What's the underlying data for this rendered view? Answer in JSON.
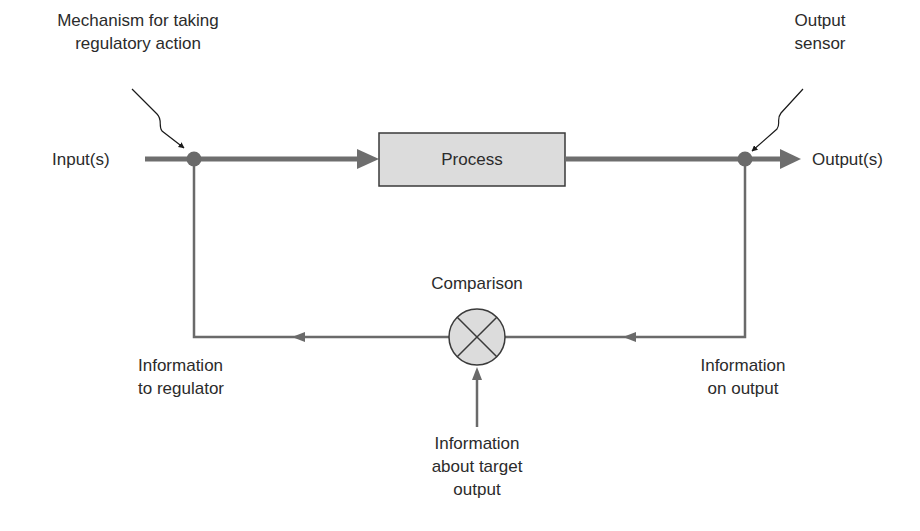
{
  "diagram": {
    "type": "feedback control loop",
    "nodes": {
      "process": {
        "label": "Process"
      },
      "comparison": {
        "label": "Comparison",
        "symbol": "circle-with-x"
      },
      "regulator_node": {
        "description": "mechanism junction on input line"
      },
      "sensor_node": {
        "description": "output sensor junction"
      }
    },
    "labels": {
      "mechanism": {
        "lines": [
          "Mechanism for taking",
          "regulatory action"
        ]
      },
      "output_sensor": {
        "lines": [
          "Output",
          "sensor"
        ]
      },
      "inputs": {
        "text": "Input(s)"
      },
      "outputs": {
        "text": "Output(s)"
      },
      "comparison": {
        "text": "Comparison"
      },
      "info_to_regulator": {
        "lines": [
          "Information",
          "to regulator"
        ]
      },
      "info_on_output": {
        "lines": [
          "Information",
          "on output"
        ]
      },
      "info_target": {
        "lines": [
          "Information",
          "about target",
          "output"
        ]
      }
    },
    "edges": [
      {
        "from": "Input(s)",
        "to": "Process",
        "style": "thick"
      },
      {
        "from": "Process",
        "to": "Output(s)",
        "style": "thick"
      },
      {
        "from": "Output sensor",
        "to": "Comparison",
        "label": "Information on output",
        "style": "thin"
      },
      {
        "from": "Comparison",
        "to": "Mechanism for taking regulatory action",
        "label": "Information to regulator",
        "style": "thin"
      },
      {
        "from": "Information about target output",
        "to": "Comparison",
        "style": "thin"
      }
    ],
    "colors": {
      "main_line": "#6e6e6e",
      "thin_line": "#6a6a6a",
      "box_fill": "#dcdcdc",
      "box_stroke": "#3a3a3a",
      "node_fill": "#6a6a6a",
      "text": "#2b2b2b"
    }
  }
}
